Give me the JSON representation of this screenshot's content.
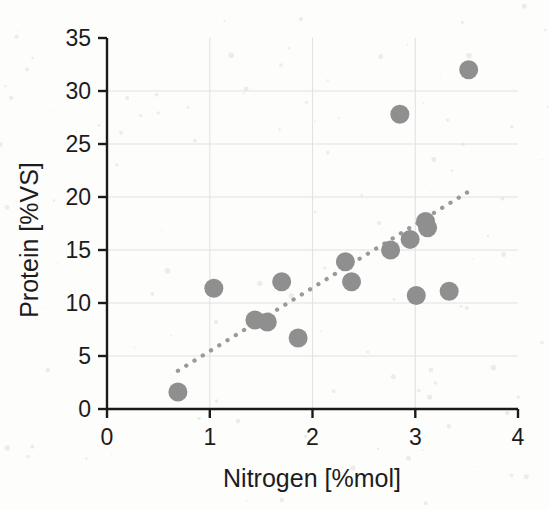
{
  "chart_data": {
    "type": "scatter",
    "title": "",
    "xlabel": "Nitrogen [%mol]",
    "ylabel": "Protein [%VS]",
    "xlim": [
      0,
      4
    ],
    "ylim": [
      0,
      35
    ],
    "xticks": [
      "0",
      "1",
      "2",
      "3",
      "4"
    ],
    "xtick_values": [
      0,
      1,
      2,
      3,
      4
    ],
    "yticks": [
      "0",
      "5",
      "10",
      "15",
      "20",
      "25",
      "30",
      "35"
    ],
    "ytick_values": [
      0,
      5,
      10,
      15,
      20,
      25,
      30,
      35
    ],
    "grid": "horizontal",
    "legend": "none",
    "marker_color": "#8f8f8f",
    "marker_shape": "circle",
    "trendline_color": "#9a9a9a",
    "trendline_style": "dotted",
    "points": [
      {
        "x": 0.69,
        "y": 1.6
      },
      {
        "x": 1.04,
        "y": 11.4
      },
      {
        "x": 1.44,
        "y": 8.4
      },
      {
        "x": 1.56,
        "y": 8.2
      },
      {
        "x": 1.7,
        "y": 12.0
      },
      {
        "x": 1.86,
        "y": 6.7
      },
      {
        "x": 2.32,
        "y": 13.9
      },
      {
        "x": 2.38,
        "y": 12.0
      },
      {
        "x": 2.76,
        "y": 15.0
      },
      {
        "x": 2.85,
        "y": 27.8
      },
      {
        "x": 2.95,
        "y": 16.0
      },
      {
        "x": 3.01,
        "y": 10.7
      },
      {
        "x": 3.1,
        "y": 17.7
      },
      {
        "x": 3.12,
        "y": 17.1
      },
      {
        "x": 3.33,
        "y": 11.1
      },
      {
        "x": 3.52,
        "y": 32.0
      }
    ],
    "trendline": {
      "x_start": 0.69,
      "y_start": 3.6,
      "x_end": 3.55,
      "y_end": 20.7
    }
  }
}
